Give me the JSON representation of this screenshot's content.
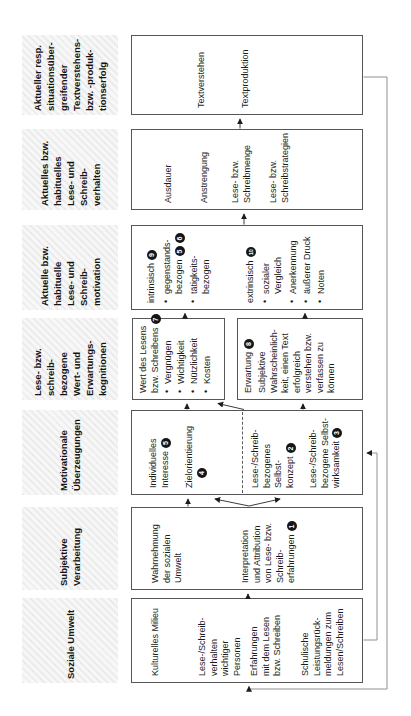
{
  "diagram": {
    "type": "flow-diagram",
    "language": "de",
    "accent_colors": {
      "box_border": "#565656",
      "arrow": "#3d3d3d",
      "feedback_line": "#909090",
      "badge_bg": "#161616",
      "header_hatch": "#ececec"
    },
    "columns": [
      {
        "id": "soziale-umwelt",
        "header_lines": [
          "Soziale Umwelt"
        ],
        "boxes": [
          {
            "id": "soziale-umwelt-box",
            "items": [
              {
                "lines": [
                  {
                    "t": "Kulturelles Milieu"
                  }
                ]
              },
              {
                "lines": [
                  {
                    "t": "Lese-/Schreib-"
                  },
                  {
                    "t": "verhalten"
                  },
                  {
                    "t": "wichtiger"
                  },
                  {
                    "t": "Personen"
                  }
                ]
              },
              {
                "lines": [
                  {
                    "t": "Erfahrungen"
                  },
                  {
                    "t": "mit dem Lesen"
                  },
                  {
                    "t": "bzw. Schreiben"
                  }
                ]
              },
              {
                "lines": [
                  {
                    "t": "Schulische"
                  },
                  {
                    "t": "Leistungsrück-"
                  },
                  {
                    "t": "meldungen zum"
                  },
                  {
                    "t": "Lesen/Schreiben"
                  }
                ]
              }
            ]
          }
        ]
      },
      {
        "id": "subjektive-verarbeitung",
        "header_lines": [
          "Subjektive",
          "Verarbeitung"
        ],
        "boxes": [
          {
            "id": "subjektive-box",
            "items": [
              {
                "lines": [
                  {
                    "t": "Wahrnehmung"
                  },
                  {
                    "t": "der sozialen"
                  },
                  {
                    "t": "Umwelt"
                  }
                ]
              },
              {
                "lines": [
                  {
                    "t": "Interpretation"
                  },
                  {
                    "t": "und Attribution"
                  },
                  {
                    "t": "von Lese- bzw."
                  },
                  {
                    "t": "Schreib-"
                  },
                  {
                    "t": "erfahrungen",
                    "badges": [
                      "1"
                    ]
                  }
                ]
              }
            ]
          }
        ]
      },
      {
        "id": "motivationale-ueberzeugungen",
        "header_lines": [
          "Motivationale",
          "Überzeugungen"
        ],
        "boxes": [
          {
            "id": "motivationale-box",
            "items": [
              {
                "lines": [
                  {
                    "t": "Individuelles"
                  },
                  {
                    "t": "Interesse",
                    "badges": [
                      "5"
                    ]
                  }
                ]
              },
              {
                "lines": [
                  {
                    "t": "Zielorientierung"
                  },
                  {
                    "t": "",
                    "badges": [
                      "4"
                    ],
                    "indent": true
                  }
                ]
              },
              {
                "lines": [
                  {
                    "t": "Lese-/Schreib-"
                  },
                  {
                    "t": "bezogenes"
                  },
                  {
                    "t": "Selbst-"
                  },
                  {
                    "t": "konzept",
                    "badges": [
                      "2"
                    ]
                  }
                ]
              },
              {
                "lines": [
                  {
                    "t": "Lese-/Schreib-"
                  },
                  {
                    "t": "bezogene Selbst-"
                  },
                  {
                    "t": "wirksamkeit",
                    "badges": [
                      "3"
                    ]
                  }
                ]
              }
            ]
          }
        ]
      },
      {
        "id": "wert-erwartungskognitionen",
        "header_lines": [
          "Lese- bzw.",
          "schreib-",
          "bezogene",
          "Wert- und",
          "Erwartungs-",
          "kognitionen"
        ],
        "boxes": [
          {
            "id": "wert-box",
            "items": [
              {
                "lines": [
                  {
                    "t": "Wert des Lesens"
                  },
                  {
                    "t": "bzw. Schreibens",
                    "badges": [
                      "7"
                    ]
                  }
                ]
              },
              {
                "bullet": true,
                "lines": [
                  {
                    "t": "Vergnügen"
                  }
                ]
              },
              {
                "bullet": true,
                "lines": [
                  {
                    "t": "Wichtigkeit"
                  }
                ]
              },
              {
                "bullet": true,
                "lines": [
                  {
                    "t": "Nützlichkeit"
                  }
                ]
              },
              {
                "bullet": true,
                "lines": [
                  {
                    "t": "Kosten"
                  }
                ]
              }
            ]
          },
          {
            "id": "erwartung-box",
            "items": [
              {
                "lines": [
                  {
                    "t": "Erwartung",
                    "badges": [
                      "8"
                    ]
                  }
                ]
              },
              {
                "lines": [
                  {
                    "t": "Subjektive"
                  },
                  {
                    "t": "Wahrscheinlich-"
                  },
                  {
                    "t": "keit, einen Text"
                  },
                  {
                    "t": "erfolgreich"
                  },
                  {
                    "t": "verstehen bzw."
                  },
                  {
                    "t": "verfassen zu"
                  },
                  {
                    "t": "können"
                  }
                ]
              }
            ]
          }
        ]
      },
      {
        "id": "lese-schreibmotivation",
        "header_lines": [
          "Aktuelle bzw.",
          "habituelle",
          "Lese- und",
          "Schreib-",
          "motivation"
        ],
        "boxes": [
          {
            "id": "motivation-box",
            "items": [
              {
                "lines": [
                  {
                    "t": "intrinsisch",
                    "badges": [
                      "9"
                    ]
                  }
                ]
              },
              {
                "bullet": true,
                "lines": [
                  {
                    "t": "gegenstands-"
                  },
                  {
                    "t": "bezogen",
                    "badges": [
                      "5",
                      "6"
                    ]
                  }
                ]
              },
              {
                "bullet": true,
                "lines": [
                  {
                    "t": "tätigkeits-"
                  },
                  {
                    "t": "bezogen"
                  }
                ]
              },
              {
                "lines": [
                  {
                    "t": "extrinsisch",
                    "badges": [
                      "10"
                    ]
                  }
                ]
              },
              {
                "bullet": true,
                "lines": [
                  {
                    "t": "sozialer"
                  },
                  {
                    "t": "Vergleich"
                  }
                ]
              },
              {
                "bullet": true,
                "lines": [
                  {
                    "t": "Anerkennung"
                  }
                ]
              },
              {
                "bullet": true,
                "lines": [
                  {
                    "t": "äußerer Druck"
                  }
                ]
              },
              {
                "bullet": true,
                "lines": [
                  {
                    "t": "Noten"
                  }
                ]
              }
            ]
          }
        ]
      },
      {
        "id": "lese-schreibverhalten",
        "header_lines": [
          "Aktuelles bzw.",
          "habituelles",
          "Lese- und",
          "Schreib-",
          "verhalten"
        ],
        "boxes": [
          {
            "id": "verhalten-box",
            "items": [
              {
                "lines": [
                  {
                    "t": "Ausdauer"
                  }
                ]
              },
              {
                "lines": [
                  {
                    "t": "Anstrengung"
                  }
                ]
              },
              {
                "lines": [
                  {
                    "t": "Lese- bzw."
                  },
                  {
                    "t": "Schreibmenge"
                  }
                ]
              },
              {
                "lines": [
                  {
                    "t": "Lese- bzw."
                  },
                  {
                    "t": "Schreibstrategien"
                  }
                ]
              }
            ]
          }
        ]
      },
      {
        "id": "textverstehenserfolg",
        "header_lines": [
          "Aktueller resp.",
          "situationsüber-",
          "greifender",
          "Textverstehens-",
          "bzw. -produk-",
          "tionserfolg"
        ],
        "boxes": [
          {
            "id": "erfolg-box",
            "items": [
              {
                "lines": [
                  {
                    "t": "Textverstehen"
                  }
                ]
              },
              {
                "lines": [
                  {
                    "t": "Textproduktion"
                  }
                ]
              }
            ]
          }
        ]
      }
    ]
  }
}
